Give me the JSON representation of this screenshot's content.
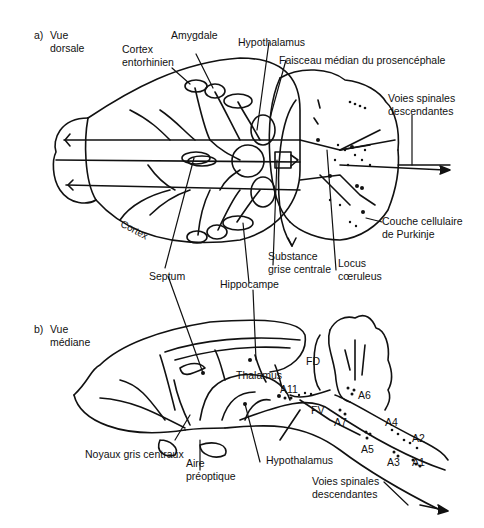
{
  "panel_a": {
    "title_letter": "a)",
    "title_line1": "Vue",
    "title_line2": "dorsale",
    "labels": {
      "amygdale": "Amygdale",
      "hypothalamus": "Hypothalamus",
      "cortex_ento_1": "Cortex",
      "cortex_ento_2": "entorhinien",
      "faisceau": "Faisceau médian du prosencéphale",
      "voies_1": "Voies spinales",
      "voies_2": "descendantes",
      "cortex": "Cortex",
      "couche_1": "Couche cellulaire",
      "couche_2": "de Purkinje",
      "septum": "Septum",
      "substance_1": "Substance",
      "substance_2": "grise centrale",
      "locus_1": "Locus",
      "locus_2": "cœruleus",
      "hippocampe": "Hippocampe"
    }
  },
  "panel_b": {
    "title_letter": "b)",
    "title_line1": "Vue",
    "title_line2": "médiane",
    "labels": {
      "thalamus": "Thalamus",
      "fd": "FD",
      "fv": "FV",
      "a11": "A11",
      "a6": "A6",
      "a7": "A7",
      "a4": "A4",
      "a5": "A5",
      "a2": "A2",
      "a3": "A3",
      "a1": "A1",
      "noyaux": "Noyaux gris centraux",
      "aire_1": "Aire",
      "aire_2": "préoptique",
      "hypothalamus": "Hypothalamus",
      "voies_1": "Voies spinales",
      "voies_2": "descendantes"
    }
  }
}
